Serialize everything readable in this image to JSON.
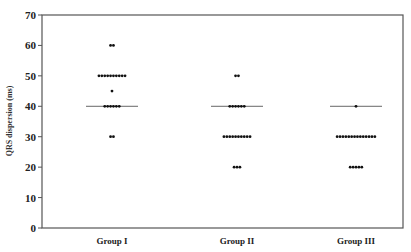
{
  "chart_data": {
    "type": "scatter",
    "subtype": "dot-plot",
    "title": "",
    "xlabel": "",
    "ylabel": "QRS dispersion (ms)",
    "ylim": [
      0,
      70
    ],
    "yticks": [
      0,
      10,
      20,
      30,
      40,
      50,
      60,
      70
    ],
    "grid": false,
    "legend": null,
    "categories": [
      "Group I",
      "Group II",
      "Group III"
    ],
    "groups": [
      {
        "name": "Group I",
        "median": 40,
        "points": [
          {
            "value": 60,
            "count": 2
          },
          {
            "value": 50,
            "count": 10
          },
          {
            "value": 45,
            "count": 1
          },
          {
            "value": 40,
            "count": 6
          },
          {
            "value": 30,
            "count": 2
          }
        ]
      },
      {
        "name": "Group II",
        "median": 40,
        "points": [
          {
            "value": 50,
            "count": 2
          },
          {
            "value": 40,
            "count": 6
          },
          {
            "value": 30,
            "count": 10
          },
          {
            "value": 20,
            "count": 3
          }
        ]
      },
      {
        "name": "Group III",
        "median": 40,
        "points": [
          {
            "value": 40,
            "count": 1
          },
          {
            "value": 30,
            "count": 14
          },
          {
            "value": 20,
            "count": 5
          }
        ]
      }
    ]
  },
  "colors": {
    "dot": "#111111",
    "axis": "#555555",
    "median_line": "#666666"
  }
}
